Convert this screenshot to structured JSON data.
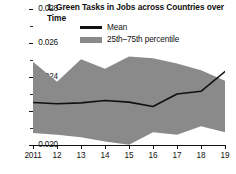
{
  "chart_data": {
    "type": "area",
    "title": "1. Green Tasks in Jobs across Countries over Time",
    "xlabel": "",
    "ylabel": "",
    "ylim": [
      0.02,
      0.028
    ],
    "xlim": [
      2011,
      2019
    ],
    "grid": false,
    "legend_position": "top-center",
    "ytick_labels": [
      "0.028",
      "0.026",
      "0.024",
      "0.022",
      "0.020"
    ],
    "ytick_values": [
      0.028,
      0.026,
      0.024,
      0.022,
      0.02
    ],
    "yminor_values": [
      0.027,
      0.025,
      0.023,
      0.021
    ],
    "x": [
      2011,
      2012,
      2013,
      2014,
      2015,
      2016,
      2017,
      2018,
      2019
    ],
    "xtick_labels": [
      "2011",
      "12",
      "13",
      "14",
      "15",
      "16",
      "17",
      "18",
      "19"
    ],
    "series": [
      {
        "name": "Mean",
        "type": "line",
        "color": "#111111",
        "values": [
          0.0225,
          0.02243,
          0.02248,
          0.02262,
          0.02252,
          0.02226,
          0.023,
          0.02316,
          0.02432
        ]
      },
      {
        "name": "25th–75th percentile",
        "type": "band",
        "color": "#8a8a8a",
        "upper": [
          0.0249,
          0.02372,
          0.02505,
          0.02448,
          0.0252,
          0.0251,
          0.0248,
          0.0244,
          0.02378
        ],
        "lower": [
          0.0207,
          0.0206,
          0.02045,
          0.0202,
          0.02002,
          0.02075,
          0.0206,
          0.0211,
          0.02075
        ]
      }
    ]
  },
  "legend": {
    "items": [
      {
        "label": "Mean",
        "swatch": "line"
      },
      {
        "label": "25th–75th percentile",
        "swatch": "band"
      }
    ]
  },
  "axes": {
    "y_labels": [
      "0.028",
      "0.026",
      "0.024",
      "0.022",
      "0.020"
    ],
    "x_labels": [
      "2011",
      "12",
      "13",
      "14",
      "15",
      "16",
      "17",
      "18",
      "19"
    ]
  }
}
